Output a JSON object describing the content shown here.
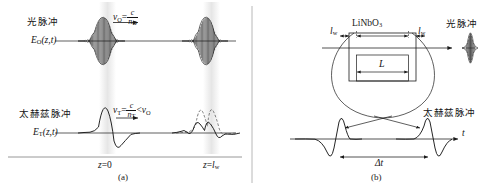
{
  "figure": {
    "width": 498,
    "height": 189,
    "ink_color": "#1a1a1a",
    "band_color": "#e8e8e8",
    "dashed_color": "#555555"
  },
  "panel_a": {
    "caption": "(a)",
    "optical": {
      "name_cjk": "光脉冲",
      "field_symbol": "E",
      "field_sub": "O",
      "field_args": "(z,t)",
      "velocity_symbol": "v",
      "velocity_sub": "O",
      "velocity_equals": "=",
      "velocity_num": "c",
      "velocity_den_n": "n",
      "velocity_den_sub": "O"
    },
    "terahertz": {
      "name_cjk": "太赫兹脉冲",
      "field_symbol": "E",
      "field_sub": "T",
      "field_args": "(z,t)",
      "velocity_symbol": "v",
      "velocity_sub": "T",
      "velocity_equals": "=",
      "velocity_num": "c",
      "velocity_den_n": "n",
      "velocity_den_sub": "T",
      "compare": "<",
      "compare_symbol": "v",
      "compare_sub": "O"
    },
    "axis_left_label": {
      "var": "z",
      "eq": "=",
      "val": "0"
    },
    "axis_right_label": {
      "var": "z",
      "eq": "=",
      "val": "l",
      "val_sub": "w"
    }
  },
  "panel_b": {
    "caption": "(b)",
    "crystal_label": "LiNbO",
    "crystal_sub": "3",
    "walkoff_left": {
      "var": "l",
      "sub": "w"
    },
    "walkoff_right": {
      "var": "l",
      "sub": "w"
    },
    "length_label": "L",
    "optical_name_cjk": "光脉冲",
    "terahertz_name_cjk": "太赫兹脉冲",
    "time_axis_label": "t",
    "delay_label": "Δt"
  }
}
